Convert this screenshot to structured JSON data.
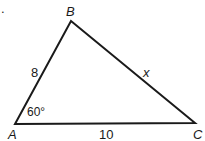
{
  "figure": {
    "type": "triangle",
    "vertices": {
      "A": {
        "label": "A",
        "x": 15,
        "y": 124
      },
      "B": {
        "label": "B",
        "x": 71,
        "y": 21
      },
      "C": {
        "label": "C",
        "x": 195,
        "y": 123
      }
    },
    "sides": {
      "AB": {
        "label": "8"
      },
      "BC": {
        "label": "x"
      },
      "AC": {
        "label": "10"
      }
    },
    "angles": {
      "A": {
        "label": "60°"
      }
    },
    "stroke_color": "#1a1a1a"
  },
  "marker": "."
}
